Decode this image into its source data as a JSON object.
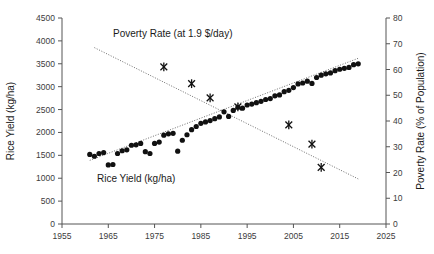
{
  "chart_data": {
    "type": "scatter",
    "title": "",
    "xlabel": "",
    "xlim": [
      1955,
      2025
    ],
    "xticks": [
      1955,
      1965,
      1975,
      1985,
      1995,
      2005,
      2015,
      2025
    ],
    "grid": false,
    "legend_position": "inline-annotation",
    "axes": {
      "left": {
        "label": "Rice Yield (kg/ha)",
        "lim": [
          0,
          4500
        ],
        "ticks": [
          0,
          500,
          1000,
          1500,
          2000,
          2500,
          3000,
          3500,
          4000,
          4500
        ]
      },
      "right": {
        "label": "Poverty Rate (% of Population)",
        "lim": [
          0,
          80
        ],
        "ticks": [
          0,
          10,
          20,
          30,
          40,
          50,
          60,
          70,
          80
        ]
      }
    },
    "annotations": [
      {
        "name": "poverty-series-label",
        "text": "Poverty Rate (at 1.9 $/day)",
        "x": 1985,
        "y": 3950,
        "axis": "left"
      },
      {
        "name": "yield-series-label",
        "text": "Rice Yield (kg/ha)",
        "x": 1979,
        "y": 1020,
        "axis": "left"
      }
    ],
    "series": [
      {
        "name": "Rice Yield (kg/ha)",
        "axis": "left",
        "marker": "filled-circle",
        "color": "#111111",
        "x": [
          1961,
          1962,
          1963,
          1964,
          1965,
          1966,
          1967,
          1968,
          1969,
          1970,
          1971,
          1972,
          1973,
          1974,
          1975,
          1976,
          1977,
          1978,
          1979,
          1980,
          1981,
          1982,
          1983,
          1984,
          1985,
          1986,
          1987,
          1988,
          1989,
          1990,
          1991,
          1992,
          1993,
          1994,
          1995,
          1996,
          1997,
          1998,
          1999,
          2000,
          2001,
          2002,
          2003,
          2004,
          2005,
          2006,
          2007,
          2008,
          2009,
          2010,
          2011,
          2012,
          2013,
          2014,
          2015,
          2016,
          2017,
          2018,
          2019
        ],
        "y": [
          1520,
          1480,
          1540,
          1560,
          1290,
          1300,
          1540,
          1600,
          1620,
          1720,
          1730,
          1760,
          1580,
          1540,
          1760,
          1790,
          1940,
          1970,
          1980,
          1590,
          1830,
          1950,
          2060,
          2130,
          2200,
          2230,
          2260,
          2300,
          2340,
          2450,
          2350,
          2480,
          2550,
          2530,
          2600,
          2620,
          2650,
          2680,
          2720,
          2740,
          2800,
          2820,
          2890,
          2920,
          2980,
          3060,
          3080,
          3120,
          3070,
          3200,
          3250,
          3280,
          3300,
          3350,
          3380,
          3400,
          3420,
          3480,
          3500
        ]
      },
      {
        "name": "Poverty Rate (at 1.9 $/day)",
        "axis": "right",
        "marker": "x-cross",
        "color": "#111111",
        "x": [
          1977,
          1983,
          1987,
          1993,
          2004,
          2009,
          2011
        ],
        "y": [
          61.0,
          54.5,
          49.0,
          45.5,
          38.5,
          31.0,
          22.0
        ]
      }
    ],
    "trendlines": [
      {
        "name": "rice-yield-trend",
        "series": "Rice Yield (kg/ha)",
        "style": "dotted",
        "x0": 1961,
        "y0": 1390,
        "x1": 2019,
        "y1": 3620,
        "axis": "left"
      },
      {
        "name": "poverty-rate-trend",
        "series": "Poverty Rate (at 1.9 $/day)",
        "style": "dotted",
        "x0": 1962,
        "y0": 68.5,
        "x1": 2019,
        "y1": 17.5,
        "axis": "right"
      }
    ]
  },
  "labels": {
    "left_axis_title": "Rice Yield (kg/ha)",
    "right_axis_title": "Poverty Rate (% of Population)",
    "poverty_annotation": "Poverty Rate (at 1.9 $/day)",
    "yield_annotation": "Rice Yield (kg/ha)"
  }
}
